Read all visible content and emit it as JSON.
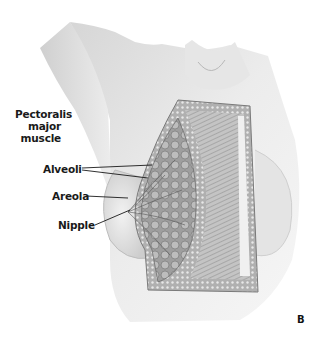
{
  "figure": {
    "panel_letter": "B",
    "labels": {
      "pectoralis_line1": "Pectoralis",
      "pectoralis_line2": "major",
      "pectoralis_line3": "muscle",
      "alveoli": "Alveoli",
      "areola": "Areola",
      "nipple": "Nipple"
    },
    "colors": {
      "background": "#ffffff",
      "skin_shade": "#d9d9d9",
      "skin_light": "#eeeeee",
      "tissue": "#9a9a9a",
      "muscle": "#b5b5b5",
      "label_text": "#1a1a1a"
    }
  }
}
